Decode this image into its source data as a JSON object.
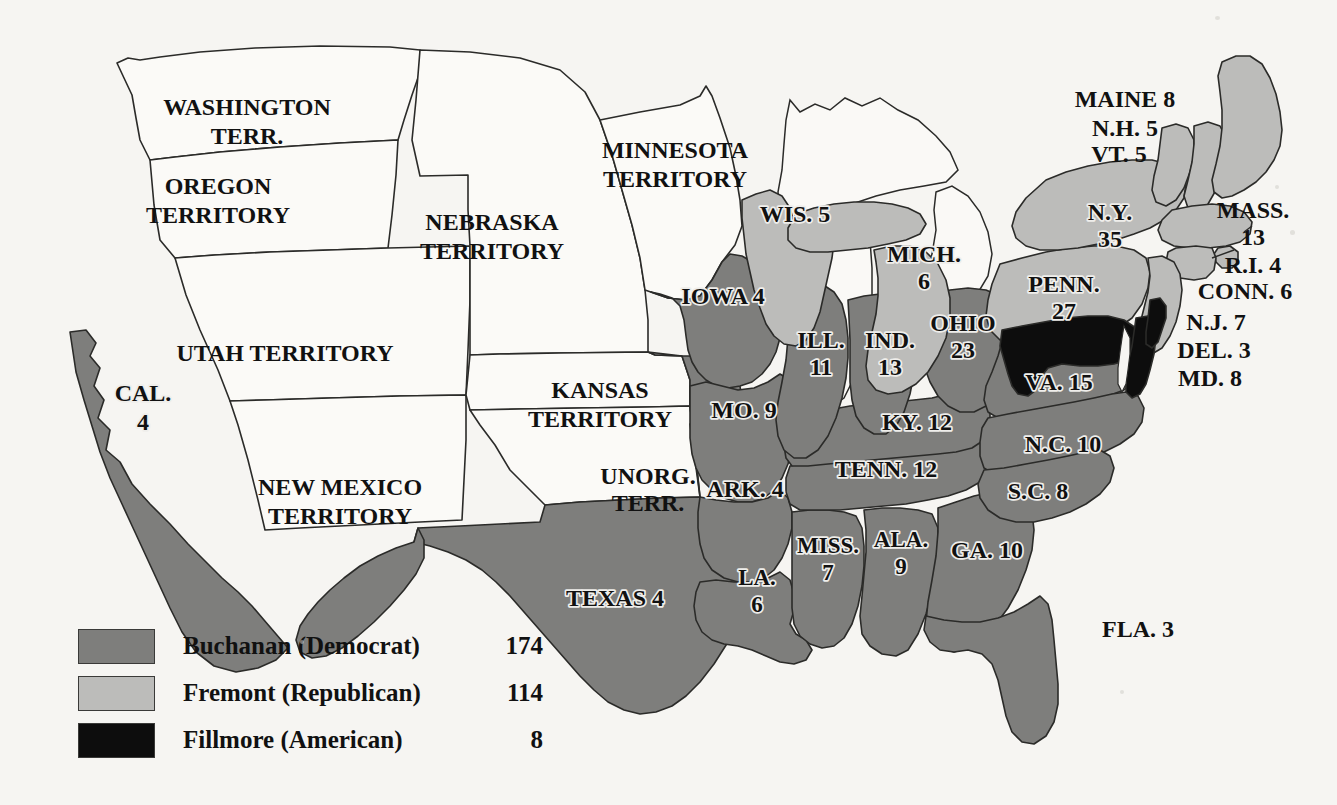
{
  "map": {
    "title": "United States Presidential Election of 1856 Electoral Map",
    "colors": {
      "background": "#f6f5f2",
      "buchanan_dark_gray": "#7e7e7c",
      "fremont_light_gray": "#bcbcba",
      "fillmore_black": "#0d0d0d",
      "territory_white": "#fbfaf7",
      "lake_white": "#fbfaf7",
      "outline": "#2b2b29"
    }
  },
  "legend": {
    "items": [
      {
        "swatch": "buchanan-swatch",
        "color": "#7e7e7c",
        "label": "Buchanan (Democrat)",
        "votes": "174"
      },
      {
        "swatch": "fremont-swatch",
        "color": "#bcbcba",
        "label": "Fremont (Republican)",
        "votes": "114"
      },
      {
        "swatch": "fillmore-swatch",
        "color": "#0d0d0d",
        "label": "Fillmore (American)",
        "votes": "8"
      }
    ]
  },
  "territories": [
    {
      "id": "washington-territory",
      "lines": [
        "WASHINGTON",
        "TERR."
      ],
      "fill": "territory"
    },
    {
      "id": "oregon-territory",
      "lines": [
        "OREGON",
        "TERRITORY"
      ],
      "fill": "territory"
    },
    {
      "id": "utah-territory",
      "lines": [
        "UTAH TERRITORY"
      ],
      "fill": "territory"
    },
    {
      "id": "new-mexico-territory",
      "lines": [
        "NEW MEXICO",
        "TERRITORY"
      ],
      "fill": "territory"
    },
    {
      "id": "nebraska-territory",
      "lines": [
        "NEBRASKA",
        "TERRITORY"
      ],
      "fill": "territory"
    },
    {
      "id": "kansas-territory",
      "lines": [
        "KANSAS",
        "TERRITORY"
      ],
      "fill": "territory"
    },
    {
      "id": "minnesota-territory",
      "lines": [
        "MINNESOTA",
        "TERRITORY"
      ],
      "fill": "territory"
    },
    {
      "id": "unorganized-territory",
      "lines": [
        "UNORG.",
        "TERR."
      ],
      "fill": "territory"
    }
  ],
  "states": [
    {
      "id": "california",
      "lines": [
        "CAL.",
        "4"
      ],
      "votes": 4,
      "winner": "buchanan"
    },
    {
      "id": "texas",
      "lines": [
        "TEXAS 4"
      ],
      "votes": 4,
      "winner": "buchanan"
    },
    {
      "id": "iowa",
      "lines": [
        "IOWA 4"
      ],
      "votes": 4,
      "winner": "buchanan"
    },
    {
      "id": "missouri",
      "lines": [
        "MO. 9"
      ],
      "votes": 9,
      "winner": "buchanan"
    },
    {
      "id": "arkansas",
      "lines": [
        "ARK. 4"
      ],
      "votes": 4,
      "winner": "buchanan"
    },
    {
      "id": "louisiana",
      "lines": [
        "LA.",
        "6"
      ],
      "votes": 6,
      "winner": "buchanan"
    },
    {
      "id": "mississippi",
      "lines": [
        "MISS.",
        "7"
      ],
      "votes": 7,
      "winner": "buchanan"
    },
    {
      "id": "alabama",
      "lines": [
        "ALA.",
        "9"
      ],
      "votes": 9,
      "winner": "buchanan"
    },
    {
      "id": "georgia",
      "lines": [
        "GA. 10"
      ],
      "votes": 10,
      "winner": "buchanan"
    },
    {
      "id": "florida",
      "lines": [
        "FLA. 3"
      ],
      "votes": 3,
      "winner": "buchanan"
    },
    {
      "id": "tennessee",
      "lines": [
        "TENN. 12"
      ],
      "votes": 12,
      "winner": "buchanan"
    },
    {
      "id": "kentucky",
      "lines": [
        "KY. 12"
      ],
      "votes": 12,
      "winner": "buchanan"
    },
    {
      "id": "illinois",
      "lines": [
        "ILL.",
        "11"
      ],
      "votes": 11,
      "winner": "buchanan"
    },
    {
      "id": "indiana",
      "lines": [
        "IND.",
        "13"
      ],
      "votes": 13,
      "winner": "buchanan"
    },
    {
      "id": "ohio",
      "lines": [
        "OHIO",
        "23"
      ],
      "votes": 23,
      "winner": "buchanan"
    },
    {
      "id": "virginia",
      "lines": [
        "VA. 15"
      ],
      "votes": 15,
      "winner": "buchanan"
    },
    {
      "id": "north-carolina",
      "lines": [
        "N.C. 10"
      ],
      "votes": 10,
      "winner": "buchanan"
    },
    {
      "id": "south-carolina",
      "lines": [
        "S.C. 8"
      ],
      "votes": 8,
      "winner": "buchanan"
    },
    {
      "id": "wisconsin",
      "lines": [
        "WIS.  5"
      ],
      "votes": 5,
      "winner": "fremont"
    },
    {
      "id": "michigan",
      "lines": [
        "MICH.",
        "6"
      ],
      "votes": 6,
      "winner": "fremont"
    },
    {
      "id": "pennsylvania",
      "lines": [
        "PENN.",
        "27"
      ],
      "votes": 27,
      "winner": "fremont"
    },
    {
      "id": "new-york",
      "lines": [
        "N.Y.",
        "35"
      ],
      "votes": 35,
      "winner": "fremont"
    },
    {
      "id": "maryland",
      "lines": [],
      "votes": 8,
      "winner": "fillmore"
    },
    {
      "id": "maine",
      "lines": [],
      "votes": 8,
      "winner": "fremont"
    },
    {
      "id": "new-hampshire",
      "lines": [],
      "votes": 5,
      "winner": "fremont"
    },
    {
      "id": "vermont",
      "lines": [],
      "votes": 5,
      "winner": "fremont"
    },
    {
      "id": "massachusetts",
      "lines": [],
      "votes": 13,
      "winner": "fremont"
    },
    {
      "id": "rhode-island",
      "lines": [],
      "votes": 4,
      "winner": "fremont"
    },
    {
      "id": "connecticut",
      "lines": [],
      "votes": 6,
      "winner": "fremont"
    },
    {
      "id": "new-jersey",
      "lines": [],
      "votes": 7,
      "winner": "fremont"
    },
    {
      "id": "delaware",
      "lines": [],
      "votes": 3,
      "winner": "fillmore"
    }
  ],
  "callouts": {
    "maine": "MAINE 8",
    "new_hampshire": "N.H. 5",
    "vermont": "VT. 5",
    "massachusetts_l1": "MASS.",
    "massachusetts_l2": "13",
    "rhode_island": "R.I. 4",
    "connecticut": "CONN. 6",
    "new_jersey": "N.J. 7",
    "delaware": "DEL. 3",
    "maryland": "MD. 8"
  },
  "state_labels": {
    "cal_l1": "CAL.",
    "cal_l2": "4",
    "texas": "TEXAS 4",
    "iowa": "IOWA 4",
    "missouri": "MO. 9",
    "arkansas": "ARK. 4",
    "louisiana_l1": "LA.",
    "louisiana_l2": "6",
    "mississippi_l1": "MISS.",
    "mississippi_l2": "7",
    "alabama_l1": "ALA.",
    "alabama_l2": "9",
    "georgia": "GA. 10",
    "florida": "FLA. 3",
    "tennessee": "TENN. 12",
    "kentucky": "KY. 12",
    "illinois_l1": "ILL.",
    "illinois_l2": "11",
    "indiana_l1": "IND.",
    "indiana_l2": "13",
    "ohio_l1": "OHIO",
    "ohio_l2": "23",
    "virginia": "VA. 15",
    "north_carolina": "N.C. 10",
    "south_carolina": "S.C. 8",
    "wisconsin": "WIS.  5",
    "michigan_l1": "MICH.",
    "michigan_l2": "6",
    "pennsylvania_l1": "PENN.",
    "pennsylvania_l2": "27",
    "new_york_l1": "N.Y.",
    "new_york_l2": "35"
  },
  "territory_labels": {
    "washington_l1": "WASHINGTON",
    "washington_l2": "TERR.",
    "oregon_l1": "OREGON",
    "oregon_l2": "TERRITORY",
    "utah": "UTAH TERRITORY",
    "new_mexico_l1": "NEW MEXICO",
    "new_mexico_l2": "TERRITORY",
    "nebraska_l1": "NEBRASKA",
    "nebraska_l2": "TERRITORY",
    "kansas_l1": "KANSAS",
    "kansas_l2": "TERRITORY",
    "minnesota_l1": "MINNESOTA",
    "minnesota_l2": "TERRITORY",
    "unorg_l1": "UNORG.",
    "unorg_l2": "TERR."
  }
}
